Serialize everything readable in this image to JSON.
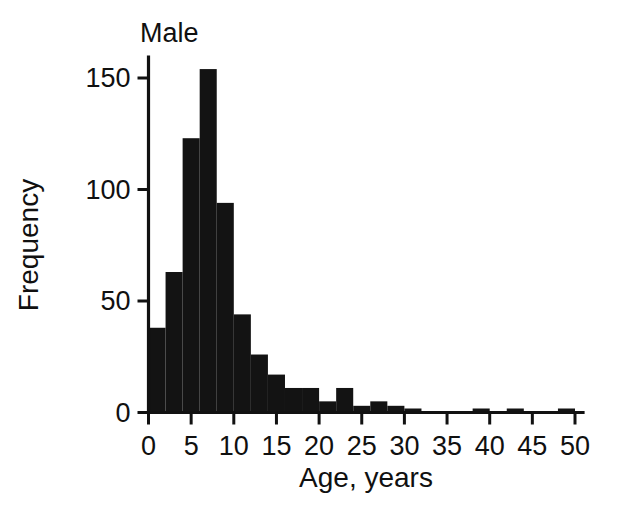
{
  "chart_data": {
    "type": "bar",
    "title": "Male",
    "xlabel": "Age, years",
    "ylabel": "Frequency",
    "bin_width": 2,
    "xlim": [
      0,
      51
    ],
    "ylim": [
      0,
      158
    ],
    "grid": false,
    "legend": null,
    "xticks": [
      0,
      5,
      10,
      15,
      20,
      25,
      30,
      35,
      40,
      45,
      50
    ],
    "xtick_labels": [
      "0",
      "5",
      "10",
      "15",
      "20",
      "25",
      "30",
      "35",
      "40",
      "45",
      "50"
    ],
    "yticks": [
      0,
      50,
      100,
      150
    ],
    "ytick_labels": [
      "0",
      "50",
      "100",
      "150"
    ],
    "bin_starts": [
      0,
      2,
      4,
      6,
      8,
      10,
      12,
      14,
      16,
      18,
      20,
      22,
      24,
      26,
      28,
      30,
      32,
      34,
      36,
      38,
      40,
      42,
      44,
      46,
      48
    ],
    "values": [
      38,
      63,
      123,
      154,
      94,
      44,
      26,
      17,
      11,
      11,
      5,
      11,
      3,
      5,
      3,
      1,
      0,
      0,
      0,
      1,
      0,
      1,
      0,
      0,
      1
    ],
    "bar_color": "#131313",
    "axis_color": "#111111",
    "background": "#ffffff"
  },
  "labels": {
    "title": "Male",
    "x_axis_title": "Age, years",
    "y_axis_title": "Frequency"
  }
}
